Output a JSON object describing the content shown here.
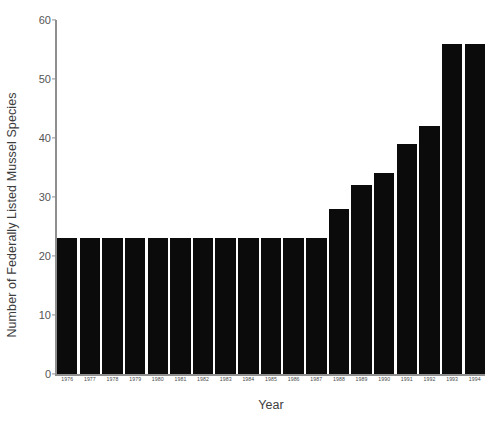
{
  "chart_data": {
    "type": "bar",
    "title": "",
    "xlabel": "Year",
    "ylabel": "Number of Federally Listed Mussel Species",
    "categories": [
      "1976",
      "1977",
      "1978",
      "1979",
      "1980",
      "1981",
      "1982",
      "1983",
      "1984",
      "1985",
      "1986",
      "1987",
      "1988",
      "1989",
      "1990",
      "1991",
      "1992",
      "1993",
      "1994"
    ],
    "values": [
      23,
      23,
      23,
      23,
      23,
      23,
      23,
      23,
      23,
      23,
      23,
      23,
      28,
      32,
      34,
      39,
      42,
      56,
      56
    ],
    "ylim": [
      0,
      60
    ],
    "yticks": [
      0,
      10,
      20,
      30,
      40,
      50,
      60
    ],
    "ytick_labels": [
      "0",
      "10",
      "20",
      "30",
      "40",
      "50",
      "60"
    ],
    "grid": false,
    "legend": "none",
    "bar_color": "#0b0b0b",
    "axis_color": "#8f8f8f",
    "background": "#ffffff"
  }
}
